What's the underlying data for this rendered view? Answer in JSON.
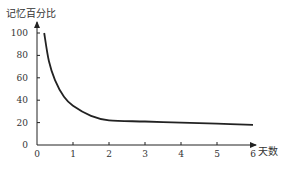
{
  "chart_data": {
    "type": "line",
    "title": "",
    "xlabel": "天数",
    "ylabel": "记忆百分比",
    "xlim": [
      0,
      6
    ],
    "ylim": [
      0,
      100
    ],
    "x_ticks": [
      "0",
      "1",
      "2",
      "3",
      "4",
      "5",
      "6"
    ],
    "y_ticks": [
      "0",
      "20",
      "40",
      "60",
      "80",
      "100"
    ],
    "grid": false,
    "legend": null,
    "series": [
      {
        "name": "遗忘曲线",
        "x": [
          0.2,
          0.33,
          0.5,
          0.75,
          1,
          1.5,
          2,
          3,
          4,
          5,
          6
        ],
        "values": [
          100,
          75,
          58,
          43,
          35,
          26,
          22,
          21,
          20,
          19,
          18
        ]
      }
    ]
  }
}
